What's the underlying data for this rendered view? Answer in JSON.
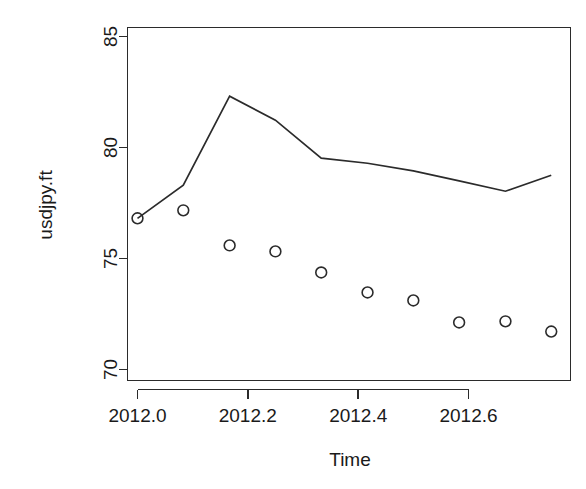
{
  "chart_data": {
    "type": "line",
    "title": "",
    "subtitle": "",
    "xlabel": "Time",
    "ylabel": "usdjpy.ft",
    "xlim": [
      2011.97,
      2012.79
    ],
    "ylim": [
      69.3,
      85.6
    ],
    "grid": false,
    "legend": null,
    "xticks": [
      2012.0,
      2012.2,
      2012.4,
      2012.6
    ],
    "xtick_labels": [
      "2012.0",
      "2012.2",
      "2012.4",
      "2012.6"
    ],
    "yticks": [
      70,
      75,
      80,
      85
    ],
    "ytick_labels": [
      "70",
      "75",
      "80",
      "85"
    ],
    "box": true,
    "series": [
      {
        "name": "fitted-line",
        "marker": "none",
        "style": "solid",
        "color": "#2b2b2b",
        "x": [
          2012.0,
          2012.083,
          2012.167,
          2012.25,
          2012.333,
          2012.417,
          2012.5,
          2012.583,
          2012.667,
          2012.75
        ],
        "values": [
          76.81,
          78.3,
          82.31,
          81.23,
          79.52,
          79.29,
          78.95,
          78.5,
          78.03,
          78.75
        ]
      },
      {
        "name": "observed-points",
        "marker": "open-circle",
        "style": "points",
        "color": "#2b2b2b",
        "x": [
          2012.0,
          2012.083,
          2012.167,
          2012.25,
          2012.333,
          2012.417,
          2012.5,
          2012.583,
          2012.667,
          2012.75
        ],
        "values": [
          76.81,
          77.17,
          75.59,
          75.32,
          74.37,
          73.47,
          73.11,
          72.12,
          72.17,
          71.71
        ]
      }
    ],
    "annotations": []
  }
}
